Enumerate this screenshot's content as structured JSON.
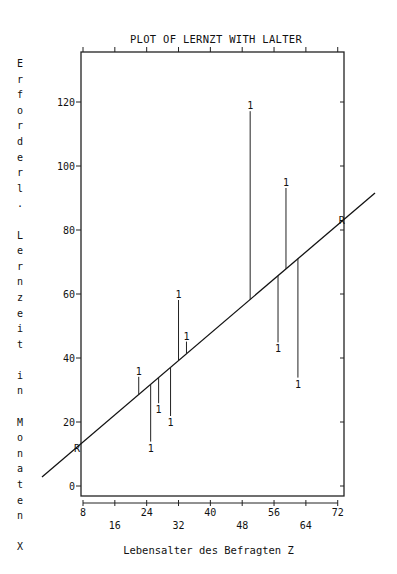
{
  "chart_data": {
    "type": "scatter",
    "title": "PLOT OF LERNZT WITH LALTER",
    "xlabel": "Lebensalter des Befragten Z",
    "ylabel": "Erforderl. Lernzeit in Monaten X",
    "x_ticks": [
      8,
      16,
      24,
      32,
      40,
      48,
      56,
      64,
      72
    ],
    "y_ticks": [
      0,
      20,
      40,
      60,
      80,
      100,
      120
    ],
    "xlim": [
      6,
      74
    ],
    "ylim": [
      -3,
      135
    ],
    "grid": false,
    "legend": null,
    "point_marker": "1",
    "series": [
      {
        "name": "observations",
        "points": [
          {
            "x": 22,
            "y": 36
          },
          {
            "x": 25,
            "y": 12
          },
          {
            "x": 27,
            "y": 24
          },
          {
            "x": 30,
            "y": 20
          },
          {
            "x": 32,
            "y": 60
          },
          {
            "x": 34,
            "y": 47
          },
          {
            "x": 50,
            "y": 119
          },
          {
            "x": 57,
            "y": 43
          },
          {
            "x": 59,
            "y": 95
          },
          {
            "x": 62,
            "y": 32
          }
        ]
      }
    ],
    "regression_line": {
      "marker": "R",
      "points": [
        {
          "x": 6.5,
          "y": 12
        },
        {
          "x": 73,
          "y": 83
        }
      ],
      "extended_line": [
        {
          "x": -3,
          "y": 3
        },
        {
          "x": 81,
          "y": 92
        }
      ]
    },
    "residual_lines": true
  },
  "labels": {
    "title": "PLOT OF LERNZT WITH LALTER",
    "xlabel": "Lebensalter des Befragten Z",
    "ylabel_vertical": "E\nr\nf\no\nr\nd\ne\nr\nl\n.\n\nL\ne\nr\nn\nz\ne\ni\nt\n\ni\nn\n\nM\no\nn\na\nt\ne\nn\n\nX"
  }
}
